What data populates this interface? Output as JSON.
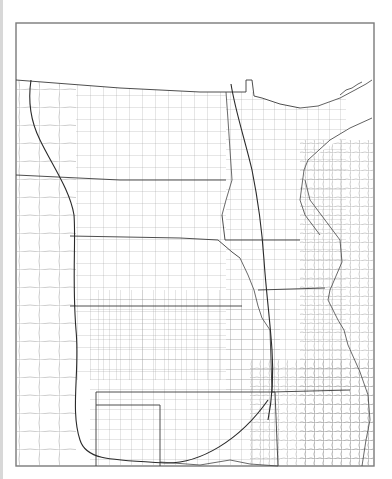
{
  "map": {
    "type": "county-boundary map",
    "region": "North-central United States",
    "frame": {
      "x": 16,
      "y": 23,
      "width": 358,
      "height": 443
    },
    "colors": {
      "background": "#ffffff",
      "frame": "#7a7a7a",
      "state_lines": "#3a3a3a",
      "county_lines": "#9a9a9a",
      "arc_lines": "#2a2a2a"
    },
    "features": [
      {
        "name": "western-arc",
        "description": "curved boundary from top-left bending down and along the southern edge"
      },
      {
        "name": "eastern-line",
        "description": "near-vertical line running from northern border southward, curving southwest at the bottom"
      }
    ],
    "labels": []
  }
}
